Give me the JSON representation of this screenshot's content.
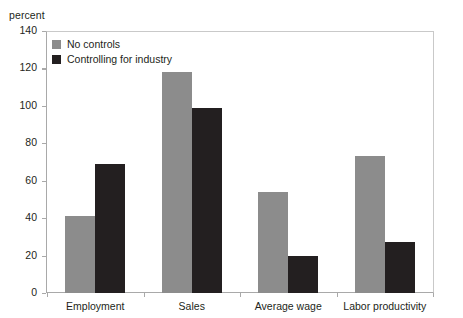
{
  "chart_data": {
    "type": "bar",
    "title": "",
    "xlabel": "",
    "ylabel": "percent",
    "ylim": [
      0,
      140
    ],
    "yticks": [
      0,
      20,
      40,
      60,
      80,
      100,
      120,
      140
    ],
    "grid": false,
    "legend_position": "top-left",
    "categories": [
      "Employment",
      "Sales",
      "Average wage",
      "Labor productivity"
    ],
    "series": [
      {
        "name": "No controls",
        "color": "#8c8c8c",
        "values": [
          41,
          118,
          54,
          73
        ]
      },
      {
        "name": "Controlling for industry",
        "color": "#231f20",
        "values": [
          69,
          99,
          20,
          27
        ]
      }
    ]
  },
  "axis": {
    "unit_label": "percent",
    "tick_labels": [
      "0",
      "20",
      "40",
      "60",
      "80",
      "100",
      "120",
      "140"
    ]
  },
  "colors": {
    "series_no_controls": "#8c8c8c",
    "series_controlling": "#231f20",
    "axis_line": "#a9a9a9",
    "frame_line": "#c9c9c9",
    "background": "#ffffff",
    "text": "#231f20"
  }
}
